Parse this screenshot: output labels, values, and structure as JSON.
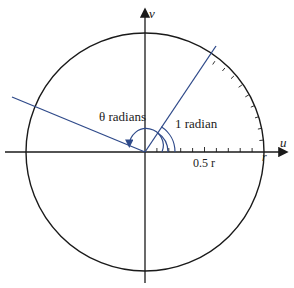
{
  "diagram": {
    "axes": {
      "horizontal": "u",
      "vertical": "v"
    },
    "labels": {
      "theta": "θ radians",
      "one_radian": "1 radian",
      "half_r": "0.5 r",
      "r": "r"
    },
    "colors": {
      "circle": "#1a1a1a",
      "rays": "#2f4a8a",
      "axes": "#1a1a1a"
    },
    "geometry": {
      "center": [
        145,
        152
      ],
      "radius": 119,
      "ray1_angle_deg": 57.3,
      "theta_angle_deg": 157
    }
  }
}
